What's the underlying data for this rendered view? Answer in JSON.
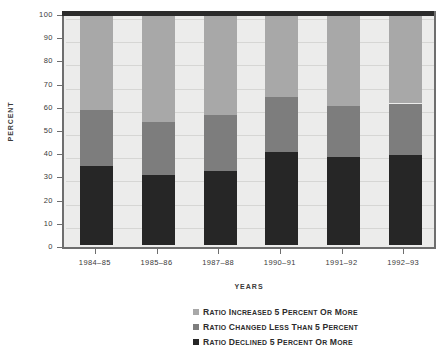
{
  "chart_data": {
    "type": "bar",
    "subtype": "stacked-bar-100",
    "title": "",
    "xlabel": "YEARS",
    "ylabel": "PERCENT",
    "ylim": [
      0,
      100
    ],
    "yticks": [
      0,
      10,
      20,
      30,
      40,
      50,
      60,
      70,
      80,
      90,
      100
    ],
    "ytick_labels": [
      "0",
      "10",
      "20",
      "30",
      "40",
      "50",
      "60",
      "70",
      "80",
      "90",
      "100"
    ],
    "grid": true,
    "legend_position": "bottom-right",
    "categories": [
      "1984–85",
      "1985–86",
      "1987–88",
      "1990–91",
      "1991–92",
      "1992–93"
    ],
    "series": [
      {
        "name": "Ratio Declined 5 percent or more",
        "color": "#262626",
        "values": [
          34,
          30,
          32,
          40,
          38,
          39
        ]
      },
      {
        "name": "Ratio Changed Less Than 5 percent",
        "color": "#7d7d7d",
        "values": [
          24,
          23,
          24,
          24,
          22,
          22
        ]
      },
      {
        "name": "Ratio Increased 5 percent or more",
        "color": "#a8a8a8",
        "values": [
          42,
          47,
          44,
          36,
          40,
          39
        ]
      }
    ],
    "cumulative_tops": {
      "declined": [
        34,
        30,
        32,
        40,
        38,
        39
      ],
      "changed_less": [
        58,
        53,
        56,
        64,
        60,
        61
      ],
      "increased": [
        100,
        100,
        100,
        100,
        100,
        100
      ]
    }
  },
  "legend": {
    "items": [
      {
        "label": "Ratio Increased 5 percent or more",
        "color": "#a8a8a8"
      },
      {
        "label": "Ratio Changed Less Than 5 percent",
        "color": "#7d7d7d"
      },
      {
        "label": "Ratio Declined 5 percent or more",
        "color": "#262626"
      }
    ]
  },
  "colors": {
    "plot_background": "#ececeb",
    "axis": "#6e6e6e",
    "gridline": "#d6d6d4",
    "top_border": "#2b2b2b",
    "text": "#3a3a3a"
  }
}
